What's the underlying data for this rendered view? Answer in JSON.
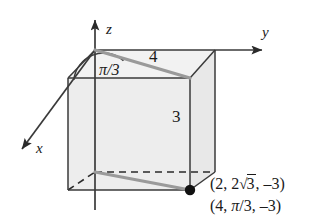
{
  "figure": {
    "background_color": "#ffffff",
    "box_fill_color": "#ededed",
    "box_edge_color": "#3a3a3a",
    "ray_color": "#9a9a9a",
    "axis_color": "#3a3a3a",
    "text_color": "#1a1a1a",
    "axes": {
      "x_label": "x",
      "y_label": "y",
      "z_label": "z"
    },
    "angle": {
      "label": "π/3"
    },
    "lengths": {
      "radial": "4",
      "height": "3"
    },
    "point": {
      "rectangular_prefix": "(2, 2",
      "rectangular_radical_symbol": "√",
      "rectangular_radical_arg": "3",
      "rectangular_suffix": ", –3)",
      "cylindrical_prefix": "(4, ",
      "cylindrical_angle": "π",
      "cylindrical_angle_suffix": "/3, –3)"
    }
  }
}
